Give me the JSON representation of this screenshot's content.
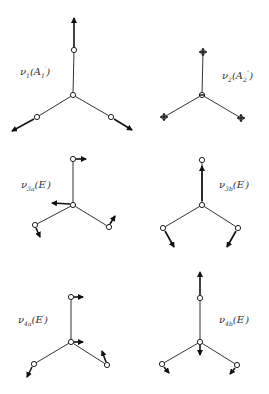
{
  "figure": {
    "modes": [
      {
        "id": "v1",
        "symbol": "ν",
        "index": "1",
        "symmetry_base": "A",
        "symmetry_sub": "1",
        "symmetry_sup": "′",
        "display": "ν1(A1′)"
      },
      {
        "id": "v2",
        "symbol": "ν",
        "index": "2",
        "symmetry_base": "A",
        "symmetry_sub": "2",
        "symmetry_sup": "″",
        "display": "ν2(A2″)"
      },
      {
        "id": "v3a",
        "symbol": "ν",
        "index": "3a",
        "symmetry_base": "E",
        "symmetry_sub": "",
        "symmetry_sup": "′",
        "display": "ν3a(E′)"
      },
      {
        "id": "v3b",
        "symbol": "ν",
        "index": "3b",
        "symmetry_base": "E",
        "symmetry_sub": "",
        "symmetry_sup": "′",
        "display": "ν3b(E′)"
      },
      {
        "id": "v4a",
        "symbol": "ν",
        "index": "4a",
        "symmetry_base": "E",
        "symmetry_sub": "",
        "symmetry_sup": "′",
        "display": "ν4a(E′)"
      },
      {
        "id": "v4b",
        "symbol": "ν",
        "index": "4b",
        "symmetry_base": "E",
        "symmetry_sub": "",
        "symmetry_sup": "′",
        "display": "ν4b(E′)"
      }
    ],
    "colors": {
      "line": "#333333",
      "arrow": "#111111",
      "background": "#ffffff"
    }
  }
}
